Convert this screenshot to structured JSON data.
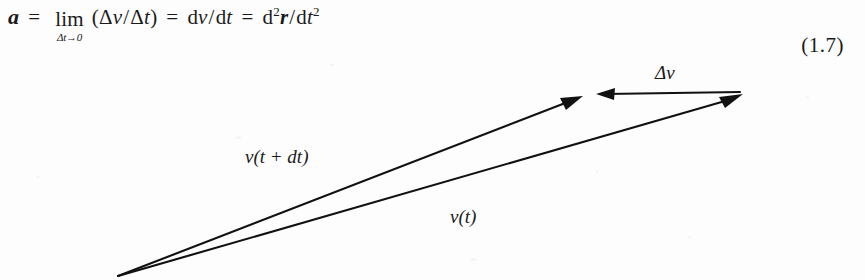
{
  "page": {
    "background_color": "#fdfdfd",
    "ink_color": "#1a1a1a"
  },
  "equation": {
    "lhs": "a",
    "equals_1": "=",
    "limit_operator": "lim",
    "limit_subscript": "Δt→0",
    "limit_argument": "(Δv/Δt)",
    "equals_2": "=",
    "first_derivative": "dv/dt",
    "equals_3": "=",
    "second_derivative_numerator": "d²r",
    "second_derivative_denominator": "dt²",
    "number": "(1.7)",
    "parts": {
      "delta": "Δ",
      "v": "v",
      "t": "t",
      "r": "r",
      "d": "d",
      "slash": "/",
      "open_paren": "(",
      "close_paren": ")",
      "two": "2"
    }
  },
  "diagram": {
    "type": "vector-triangle",
    "origin": {
      "x": 118,
      "y": 276
    },
    "labels": {
      "delta_v": "Δv",
      "v_t_plus_dt": "v(t + dt)",
      "v_t": "v(t)"
    },
    "label_positions": {
      "delta_v": {
        "x": 668,
        "y": 79
      },
      "v_t_plus_dt": {
        "x": 312,
        "y": 163
      },
      "v_t": {
        "x": 468,
        "y": 223
      }
    },
    "vectors": [
      {
        "name": "v(t + dt)",
        "from": {
          "x": 118,
          "y": 276
        },
        "to": {
          "x": 580,
          "y": 97
        },
        "arrow": "end"
      },
      {
        "name": "v(t)",
        "from": {
          "x": 118,
          "y": 276
        },
        "to": {
          "x": 740,
          "y": 95
        },
        "arrow": "end"
      },
      {
        "name": "Δv",
        "from": {
          "x": 740,
          "y": 92
        },
        "to": {
          "x": 597,
          "y": 94
        },
        "arrow": "end"
      }
    ]
  }
}
